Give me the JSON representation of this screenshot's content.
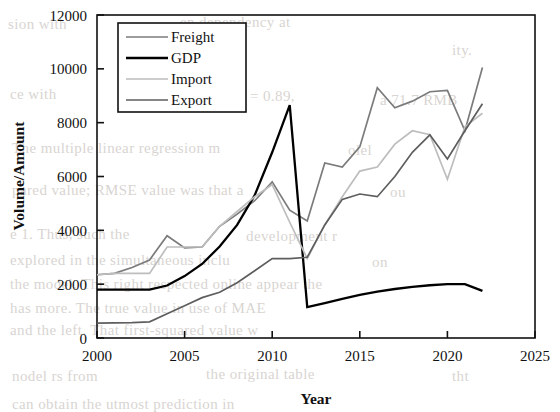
{
  "chart_data": {
    "type": "line",
    "title": "",
    "xlabel": "Year",
    "ylabel": "Volume/Amount",
    "xlim": [
      2000,
      2025
    ],
    "ylim": [
      0,
      12000
    ],
    "xticks": [
      2000,
      2005,
      2010,
      2015,
      2020,
      2025
    ],
    "yticks": [
      0,
      2000,
      4000,
      6000,
      8000,
      10000,
      12000
    ],
    "grid": false,
    "legend_position": "upper left",
    "x": [
      2000,
      2001,
      2002,
      2003,
      2004,
      2005,
      2006,
      2007,
      2008,
      2009,
      2010,
      2011,
      2012,
      2013,
      2014,
      2015,
      2016,
      2017,
      2018,
      2019,
      2020,
      2021,
      2022
    ],
    "series": [
      {
        "name": "Freight",
        "color": "#7b7b7b",
        "width": 1.7,
        "values": [
          2350,
          2400,
          2620,
          2900,
          3800,
          3350,
          3380,
          4150,
          4600,
          5100,
          5800,
          4750,
          4350,
          6500,
          6350,
          7100,
          9300,
          8550,
          8800,
          9150,
          9200,
          7700,
          10050
        ]
      },
      {
        "name": "GDP",
        "color": "#000000",
        "width": 2.3,
        "values": [
          1800,
          1800,
          1800,
          1800,
          1950,
          2300,
          2750,
          3400,
          4200,
          5300,
          6900,
          8650,
          1150,
          1300,
          1450,
          1600,
          1720,
          1820,
          1900,
          1960,
          2000,
          2000,
          1750
        ]
      },
      {
        "name": "Import",
        "color": "#bdbdbd",
        "width": 1.7,
        "values": [
          2350,
          2400,
          2400,
          2400,
          3380,
          3380,
          3380,
          4150,
          4700,
          5250,
          5700,
          4300,
          2950,
          4200,
          5250,
          6200,
          6350,
          7200,
          7700,
          7550,
          5900,
          7850,
          8350
        ]
      },
      {
        "name": "Export",
        "color": "#5e5e5e",
        "width": 1.7,
        "values": [
          550,
          560,
          570,
          600,
          900,
          1200,
          1500,
          1700,
          2050,
          2500,
          2950,
          2950,
          3000,
          4200,
          5150,
          5350,
          5250,
          6000,
          6900,
          7550,
          6650,
          7700,
          8700
        ]
      }
    ]
  },
  "legend": {
    "entries": [
      {
        "label": "Freight"
      },
      {
        "label": "GDP"
      },
      {
        "label": "Import"
      },
      {
        "label": "Export"
      }
    ]
  },
  "background_text": {
    "lines": [
      {
        "text": "sion with",
        "x": 8,
        "y": 16
      },
      {
        "text": "en dependency at",
        "x": 180,
        "y": 14
      },
      {
        "text": "ity.",
        "x": 452,
        "y": 42
      },
      {
        "text": "ce with",
        "x": 10,
        "y": 86
      },
      {
        "text": "= 0.89,",
        "x": 250,
        "y": 88
      },
      {
        "text": "a 71.7 RMB",
        "x": 380,
        "y": 92
      },
      {
        "text": "The multiple linear regression m",
        "x": 12,
        "y": 140
      },
      {
        "text": "olel",
        "x": 348,
        "y": 142
      },
      {
        "text": "pared value; RMSE value was that a",
        "x": 12,
        "y": 182
      },
      {
        "text": "ou",
        "x": 390,
        "y": 184
      },
      {
        "text": "e 1. Thus, such the",
        "x": 10,
        "y": 226
      },
      {
        "text": "development r",
        "x": 246,
        "y": 228
      },
      {
        "text": "explored in the simultaneous inclu",
        "x": 10,
        "y": 252
      },
      {
        "text": "on",
        "x": 372,
        "y": 254
      },
      {
        "text": "the model. This right respected online appear the",
        "x": 10,
        "y": 276
      },
      {
        "text": "has more. The true value in use of MAE",
        "x": 10,
        "y": 300
      },
      {
        "text": "and the left. That first-squared value w",
        "x": 10,
        "y": 322
      },
      {
        "text": "nodel rs from",
        "x": 12,
        "y": 368
      },
      {
        "text": "the original table",
        "x": 206,
        "y": 366
      },
      {
        "text": "tht",
        "x": 452,
        "y": 368
      },
      {
        "text": "can obtain the utmost prediction in",
        "x": 12,
        "y": 396
      }
    ]
  }
}
